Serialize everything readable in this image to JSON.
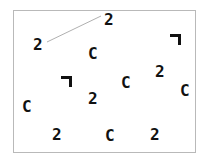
{
  "canvas": {
    "width": 209,
    "height": 164,
    "background": "#ffffff"
  },
  "frame": {
    "name": "search-display-frame",
    "x": 13,
    "y": 10,
    "width": 183,
    "height": 143,
    "border_color": "#b9b9b9",
    "fill": "#ffffff"
  },
  "connector": {
    "name": "pointer-line",
    "x1": 47,
    "y1": 42,
    "x2": 101,
    "y2": 16,
    "color": "#b0b0b0",
    "width": 1
  },
  "item_color": "#111111",
  "items": [
    {
      "label": "2",
      "kind": "digit-two",
      "x": 104,
      "y": 12
    },
    {
      "label": "2",
      "kind": "digit-two",
      "x": 33,
      "y": 37
    },
    {
      "label": "C",
      "kind": "letter-c",
      "x": 88,
      "y": 46
    },
    {
      "label": "¬",
      "kind": "corner-angle",
      "x": 170,
      "y": 34
    },
    {
      "label": "2",
      "kind": "digit-two",
      "x": 155,
      "y": 64
    },
    {
      "label": "¬",
      "kind": "corner-angle",
      "x": 61,
      "y": 76
    },
    {
      "label": "C",
      "kind": "letter-c",
      "x": 121,
      "y": 75
    },
    {
      "label": "C",
      "kind": "letter-c",
      "x": 180,
      "y": 83
    },
    {
      "label": "2",
      "kind": "digit-two",
      "x": 88,
      "y": 91
    },
    {
      "label": "C",
      "kind": "letter-c",
      "x": 22,
      "y": 99
    },
    {
      "label": "2",
      "kind": "digit-two",
      "x": 52,
      "y": 127
    },
    {
      "label": "C",
      "kind": "letter-c",
      "x": 105,
      "y": 128
    },
    {
      "label": "2",
      "kind": "digit-two",
      "x": 150,
      "y": 127
    }
  ]
}
